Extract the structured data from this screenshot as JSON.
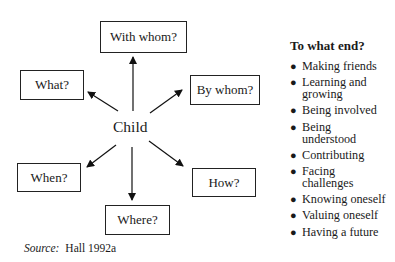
{
  "diagram": {
    "center": "Child",
    "nodes": [
      {
        "id": "with-whom",
        "label": "With whom?"
      },
      {
        "id": "what",
        "label": "What?"
      },
      {
        "id": "by-whom",
        "label": "By whom?"
      },
      {
        "id": "when",
        "label": "When?"
      },
      {
        "id": "how",
        "label": "How?"
      },
      {
        "id": "where",
        "label": "Where?"
      }
    ],
    "edges": [
      {
        "from": "Child",
        "to": "with-whom"
      },
      {
        "from": "Child",
        "to": "what"
      },
      {
        "from": "Child",
        "to": "by-whom"
      },
      {
        "from": "Child",
        "to": "when"
      },
      {
        "from": "Child",
        "to": "how"
      },
      {
        "from": "Child",
        "to": "where"
      }
    ]
  },
  "side_panel": {
    "title": "To what end?",
    "items": [
      "Making friends",
      "Learning and growing",
      "Being involved",
      "Being understood",
      "Contributing",
      "Facing challenges",
      "Knowing oneself",
      "Valuing oneself",
      "Having a future"
    ]
  },
  "source": {
    "label": "Source:",
    "text": "Hall 1992a"
  }
}
